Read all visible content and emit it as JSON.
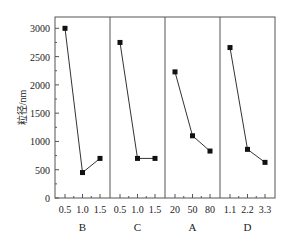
{
  "chart_data": {
    "type": "line",
    "title": "",
    "ylabel": "粒径/nm",
    "ylim": [
      0,
      3200
    ],
    "yticks": [
      0,
      500,
      1000,
      1500,
      2000,
      2500,
      3000
    ],
    "panels": [
      {
        "name": "B",
        "x": [
          "0.5",
          "1.0",
          "1.5"
        ],
        "values": [
          3000,
          450,
          700
        ]
      },
      {
        "name": "C",
        "x": [
          "0.5",
          "1.0",
          "1.5"
        ],
        "values": [
          2750,
          700,
          700
        ]
      },
      {
        "name": "A",
        "x": [
          "20",
          "50",
          "80"
        ],
        "values": [
          2230,
          1100,
          830
        ]
      },
      {
        "name": "D",
        "x": [
          "1.1",
          "2.2",
          "3.3"
        ],
        "values": [
          2660,
          860,
          630
        ]
      }
    ],
    "grid": false,
    "marker": "square",
    "line_color": "#333333"
  }
}
